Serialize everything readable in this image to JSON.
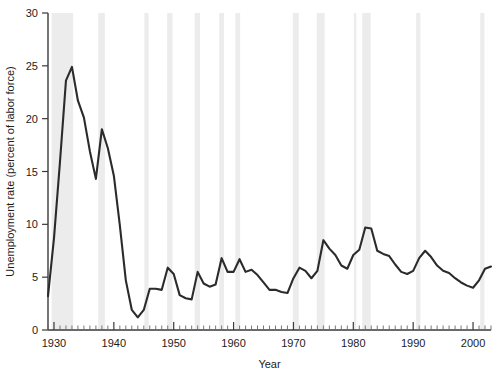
{
  "chart_data": {
    "type": "line",
    "title": "",
    "xlabel": "Year",
    "ylabel": "Unemployment rate (percent of labor force)",
    "xlim": [
      1929,
      2003
    ],
    "ylim": [
      0,
      30
    ],
    "grid": false,
    "legend": null,
    "y_ticks": [
      0,
      5,
      10,
      15,
      20,
      25,
      30
    ],
    "y_tick_labels": [
      "0",
      "5",
      "10",
      "15",
      "20",
      "25",
      "30"
    ],
    "x_ticks": [
      1930,
      1940,
      1950,
      1960,
      1970,
      1980,
      1990,
      2000
    ],
    "x_tick_labels": [
      "1930",
      "1940",
      "1950",
      "1960",
      "1970",
      "1980",
      "1990",
      "2000"
    ],
    "x_minor_tick_interval": 1,
    "series": [
      {
        "name": "Unemployment rate",
        "color": "#2b2b2b",
        "x": [
          1929,
          1930,
          1931,
          1932,
          1933,
          1934,
          1935,
          1936,
          1937,
          1938,
          1939,
          1940,
          1941,
          1942,
          1943,
          1944,
          1945,
          1946,
          1947,
          1948,
          1949,
          1950,
          1951,
          1952,
          1953,
          1954,
          1955,
          1956,
          1957,
          1958,
          1959,
          1960,
          1961,
          1962,
          1963,
          1964,
          1965,
          1966,
          1967,
          1968,
          1969,
          1970,
          1971,
          1972,
          1973,
          1974,
          1975,
          1976,
          1977,
          1978,
          1979,
          1980,
          1981,
          1982,
          1983,
          1984,
          1985,
          1986,
          1987,
          1988,
          1989,
          1990,
          1991,
          1992,
          1993,
          1994,
          1995,
          1996,
          1997,
          1998,
          1999,
          2000,
          2001,
          2002,
          2003
        ],
        "values": [
          3.2,
          8.7,
          15.9,
          23.6,
          24.9,
          21.7,
          20.1,
          16.9,
          14.3,
          19.0,
          17.2,
          14.6,
          9.9,
          4.7,
          1.9,
          1.2,
          1.9,
          3.9,
          3.9,
          3.8,
          5.9,
          5.3,
          3.3,
          3.0,
          2.9,
          5.5,
          4.4,
          4.1,
          4.3,
          6.8,
          5.5,
          5.5,
          6.7,
          5.5,
          5.7,
          5.2,
          4.5,
          3.8,
          3.8,
          3.6,
          3.5,
          4.9,
          5.9,
          5.6,
          4.9,
          5.6,
          8.5,
          7.7,
          7.1,
          6.1,
          5.8,
          7.1,
          7.6,
          9.7,
          9.6,
          7.5,
          7.2,
          7.0,
          6.2,
          5.5,
          5.3,
          5.6,
          6.8,
          7.5,
          6.9,
          6.1,
          5.6,
          5.4,
          4.9,
          4.5,
          4.2,
          4.0,
          4.7,
          5.8,
          6.0
        ]
      }
    ],
    "recession_bands": [
      {
        "start": 1929.6,
        "end": 1933.2
      },
      {
        "start": 1937.4,
        "end": 1938.5
      },
      {
        "start": 1945.1,
        "end": 1945.8
      },
      {
        "start": 1948.9,
        "end": 1949.8
      },
      {
        "start": 1953.5,
        "end": 1954.4
      },
      {
        "start": 1957.6,
        "end": 1958.4
      },
      {
        "start": 1960.3,
        "end": 1961.1
      },
      {
        "start": 1969.9,
        "end": 1970.9
      },
      {
        "start": 1973.9,
        "end": 1975.2
      },
      {
        "start": 1980.1,
        "end": 1980.5
      },
      {
        "start": 1981.5,
        "end": 1982.9
      },
      {
        "start": 1990.5,
        "end": 1991.2
      },
      {
        "start": 2001.2,
        "end": 2001.9
      }
    ],
    "band_color": "#ececec"
  }
}
